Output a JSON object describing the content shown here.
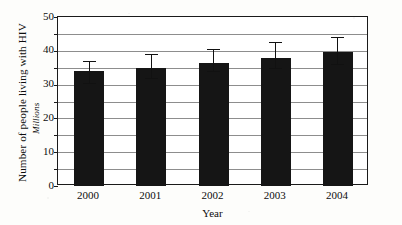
{
  "chart_data": {
    "type": "bar",
    "title": "",
    "xlabel": "Year",
    "ylabel": "Number of people living with HIV",
    "ylabel_sub": "Millions",
    "categories": [
      "2000",
      "2001",
      "2002",
      "2003",
      "2004"
    ],
    "values": [
      34,
      35,
      36.5,
      38,
      39.5
    ],
    "error_low": [
      30.5,
      32,
      34,
      35,
      36
    ],
    "error_high": [
      37,
      39,
      40.5,
      42.5,
      44
    ],
    "ylim": [
      0,
      50
    ],
    "ytick_labels": [
      "50",
      "40",
      "30",
      "20",
      "10",
      "0"
    ],
    "ytick_values": [
      50,
      40,
      30,
      20,
      10,
      0
    ],
    "yminor_values": [
      45,
      35,
      25,
      15,
      5
    ],
    "grid": true,
    "legend": "none",
    "series": [
      {
        "name": "People living with HIV",
        "values": [
          34,
          35,
          36.5,
          38,
          39.5
        ]
      }
    ],
    "colors": {
      "bar": "#151515",
      "grid": "#8d8d8d",
      "axis": "#1a1a1a",
      "plot_background": "#ffffff",
      "page_background": "#fdfdfb"
    }
  }
}
